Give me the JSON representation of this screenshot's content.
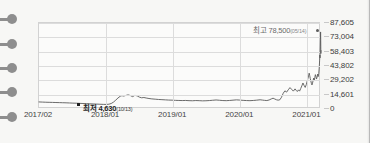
{
  "chart_data": {
    "type": "line",
    "title": "",
    "xlabel": "",
    "ylabel": "",
    "grid": true,
    "legend": "none",
    "ylim": [
      0,
      87605
    ],
    "yticks": [
      "0",
      "14,601",
      "29,202",
      "43,802",
      "58,403",
      "73,004",
      "87,605"
    ],
    "ytick_values": [
      0,
      14601,
      29202,
      43802,
      58403,
      73004,
      87605
    ],
    "xticks": [
      "2017/02",
      "2018/01",
      "2019/01",
      "2020/01",
      "2021/01"
    ],
    "annotations": [
      {
        "name": "high",
        "label": "최고 78,500",
        "date": "(05/14)",
        "value": 78500,
        "marker": "dot"
      },
      {
        "name": "low",
        "label": "최저 4,630",
        "date": "(10/13)",
        "value": 4630,
        "marker": "square"
      }
    ],
    "series": [
      {
        "name": "price",
        "color": "#5a5a5a",
        "points": [
          [
            0.0,
            7200
          ],
          [
            0.012,
            7050
          ],
          [
            0.024,
            6900
          ],
          [
            0.036,
            6800
          ],
          [
            0.048,
            6700
          ],
          [
            0.06,
            6600
          ],
          [
            0.072,
            6500
          ],
          [
            0.084,
            6400
          ],
          [
            0.096,
            6300
          ],
          [
            0.108,
            6150
          ],
          [
            0.12,
            6000
          ],
          [
            0.132,
            5900
          ],
          [
            0.144,
            5750
          ],
          [
            0.156,
            5600
          ],
          [
            0.168,
            5450
          ],
          [
            0.18,
            5300
          ],
          [
            0.192,
            5150
          ],
          [
            0.204,
            5000
          ],
          [
            0.216,
            4850
          ],
          [
            0.228,
            4700
          ],
          [
            0.238,
            4630
          ],
          [
            0.248,
            4900
          ],
          [
            0.256,
            5600
          ],
          [
            0.264,
            7000
          ],
          [
            0.272,
            9000
          ],
          [
            0.28,
            11200
          ],
          [
            0.288,
            13000
          ],
          [
            0.294,
            13600
          ],
          [
            0.3,
            13200
          ],
          [
            0.308,
            13800
          ],
          [
            0.316,
            14400
          ],
          [
            0.324,
            13700
          ],
          [
            0.332,
            12600
          ],
          [
            0.34,
            13900
          ],
          [
            0.348,
            13400
          ],
          [
            0.356,
            12100
          ],
          [
            0.364,
            11400
          ],
          [
            0.372,
            11700
          ],
          [
            0.38,
            11200
          ],
          [
            0.39,
            10700
          ],
          [
            0.4,
            10300
          ],
          [
            0.412,
            10000
          ],
          [
            0.424,
            9700
          ],
          [
            0.436,
            9500
          ],
          [
            0.448,
            9300
          ],
          [
            0.46,
            9100
          ],
          [
            0.472,
            9000
          ],
          [
            0.484,
            8800
          ],
          [
            0.496,
            8700
          ],
          [
            0.508,
            8600
          ],
          [
            0.52,
            8700
          ],
          [
            0.532,
            8500
          ],
          [
            0.544,
            8400
          ],
          [
            0.556,
            8600
          ],
          [
            0.568,
            8500
          ],
          [
            0.58,
            8300
          ],
          [
            0.592,
            8400
          ],
          [
            0.604,
            8600
          ],
          [
            0.616,
            8900
          ],
          [
            0.628,
            9200
          ],
          [
            0.64,
            8900
          ],
          [
            0.652,
            8600
          ],
          [
            0.664,
            8500
          ],
          [
            0.676,
            8700
          ],
          [
            0.688,
            9000
          ],
          [
            0.7,
            9300
          ],
          [
            0.712,
            9100
          ],
          [
            0.724,
            8800
          ],
          [
            0.736,
            8600
          ],
          [
            0.748,
            8500
          ],
          [
            0.76,
            8700
          ],
          [
            0.772,
            9000
          ],
          [
            0.784,
            9400
          ],
          [
            0.792,
            9100
          ],
          [
            0.8,
            8800
          ],
          [
            0.808,
            8600
          ],
          [
            0.816,
            9200
          ],
          [
            0.824,
            10300
          ],
          [
            0.83,
            11000
          ],
          [
            0.836,
            10200
          ],
          [
            0.842,
            9400
          ],
          [
            0.848,
            9000
          ],
          [
            0.854,
            9400
          ],
          [
            0.86,
            12000
          ],
          [
            0.866,
            16000
          ],
          [
            0.872,
            18500
          ],
          [
            0.878,
            17200
          ],
          [
            0.884,
            19600
          ],
          [
            0.89,
            21800
          ],
          [
            0.896,
            20000
          ],
          [
            0.902,
            18200
          ],
          [
            0.908,
            20500
          ],
          [
            0.912,
            19000
          ],
          [
            0.916,
            17800
          ],
          [
            0.92,
            19500
          ],
          [
            0.924,
            18200
          ],
          [
            0.928,
            20800
          ],
          [
            0.932,
            23500
          ],
          [
            0.936,
            26500
          ],
          [
            0.94,
            24000
          ],
          [
            0.944,
            22000
          ],
          [
            0.948,
            25000
          ],
          [
            0.952,
            29500
          ],
          [
            0.956,
            33500
          ],
          [
            0.958,
            36500
          ],
          [
            0.96,
            34000
          ],
          [
            0.962,
            31000
          ],
          [
            0.964,
            28500
          ],
          [
            0.966,
            26000
          ],
          [
            0.968,
            24500
          ],
          [
            0.97,
            26500
          ],
          [
            0.972,
            29000
          ],
          [
            0.974,
            31500
          ],
          [
            0.976,
            29000
          ],
          [
            0.978,
            32000
          ],
          [
            0.98,
            35000
          ],
          [
            0.982,
            33000
          ],
          [
            0.984,
            30500
          ],
          [
            0.986,
            32500
          ],
          [
            0.988,
            35500
          ],
          [
            0.99,
            33000
          ],
          [
            0.992,
            36000
          ],
          [
            0.994,
            43000
          ],
          [
            0.995,
            49000
          ],
          [
            0.996,
            55000
          ],
          [
            0.9965,
            52000
          ],
          [
            0.997,
            58000
          ],
          [
            0.9975,
            64000
          ],
          [
            0.998,
            71000
          ],
          [
            0.9985,
            78500
          ],
          [
            0.999,
            70000
          ],
          [
            0.9993,
            61000
          ],
          [
            0.9996,
            56500
          ],
          [
            1.0,
            59500
          ]
        ]
      }
    ]
  },
  "rail": {
    "markers": [
      {
        "name": "rail-pin-1"
      },
      {
        "name": "rail-pin-2"
      },
      {
        "name": "rail-pin-3"
      },
      {
        "name": "rail-pin-4"
      },
      {
        "name": "rail-pin-5"
      }
    ]
  },
  "colors": {
    "background": "#f7f7f5",
    "plot_background": "#fbfbfa",
    "grid": "#dcdcdc",
    "line": "#5a5a5a",
    "pin": "#8e8e8e",
    "axis_text": "#3c3c3c"
  }
}
